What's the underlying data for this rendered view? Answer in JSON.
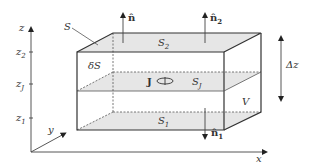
{
  "diagram": {
    "axes": {
      "x_label": "x",
      "y_label": "y",
      "z_label": "z",
      "z_ticks": [
        {
          "base": "z",
          "sub": "2"
        },
        {
          "base": "z",
          "sub": "J"
        },
        {
          "base": "z",
          "sub": "1"
        }
      ]
    },
    "labels": {
      "surface": "S",
      "top_surface": {
        "base": "S",
        "sub": "2"
      },
      "middle_surface": {
        "base": "S",
        "sub": "J"
      },
      "bottom_surface": {
        "base": "S",
        "sub": "1"
      },
      "side_surface": "δS",
      "volume": "V",
      "current": "J",
      "normal": "n̂",
      "normal_top": {
        "base": "n̂",
        "sub": "2"
      },
      "normal_bottom": {
        "base": "n̂",
        "sub": "1"
      },
      "thickness": "Δz"
    },
    "colors": {
      "line": "#333333",
      "shade": "#e6e6e6",
      "background": "#ffffff"
    }
  }
}
